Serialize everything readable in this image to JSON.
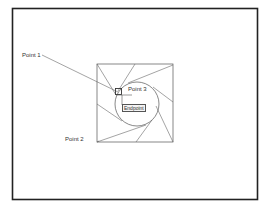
{
  "diagram": {
    "frame": {
      "x": 12,
      "y": 8,
      "width": 245,
      "height": 191,
      "stroke": "#222222"
    },
    "square": {
      "x": 97,
      "y": 64,
      "width": 76,
      "height": 78,
      "stroke": "#555555"
    },
    "circle": {
      "cx": 137,
      "cy": 104,
      "r": 22,
      "stroke": "#555555"
    },
    "labels": {
      "point1": "Point 1",
      "point2": "Point 2",
      "point3": "Point 3",
      "snap_tooltip": "Endpoint"
    },
    "colors": {
      "line": "#555555",
      "text": "#333333",
      "background": "#ffffff"
    }
  }
}
